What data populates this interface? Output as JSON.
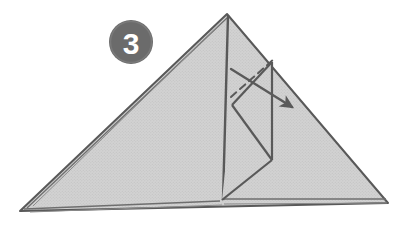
{
  "figure": {
    "kind": "origami-fold-instruction",
    "step_badge": {
      "number": "3",
      "shape": "filled-circle",
      "fill_color": "#6b6b6b",
      "text_color": "#ffffff",
      "center_x": 131,
      "center_y": 42,
      "radius": 22
    },
    "paper": {
      "fill_color": "#cfcfcf",
      "outline_color": "#595959",
      "texture": "halftone-dot-screen",
      "description": "Large flat triangle of folded paper seen from the front, apex at top center, long base at bottom."
    },
    "shapes": {
      "main_triangle": {
        "name": "main-triangle",
        "points": "227,14 20,211 388,203"
      },
      "layer_edges": [
        {
          "name": "left-layer-edge-1",
          "points": "227,18 27,208"
        },
        {
          "name": "left-layer-edge-2",
          "points": "222,22 33,206"
        },
        {
          "name": "bottom-layer-edge-1",
          "points": "24,209 220,201"
        },
        {
          "name": "bottom-layer-edge-2",
          "points": "30,212 222,205"
        },
        {
          "name": "bottom-layer-edge-3",
          "points": "222,199 386,199"
        },
        {
          "name": "bottom-layer-edge-4",
          "points": "224,204 387,203"
        }
      ],
      "center_fold_line": {
        "name": "center-vertical-fold",
        "points": "228,15 223,200"
      },
      "inner_flap": {
        "name": "inner-flap",
        "points": "272,62 272,160 222,200 232,105"
      },
      "inner_flap_edges": [
        {
          "name": "flap-right-edge",
          "points": "272,62 272,160"
        },
        {
          "name": "flap-lower-diagonal",
          "points": "272,160 222,200"
        },
        {
          "name": "flap-left-diagonal",
          "points": "232,105 272,160"
        },
        {
          "name": "flap-upper-diagonal",
          "points": "232,105 272,62"
        }
      ]
    },
    "annotations": {
      "fold_line": {
        "name": "valley-fold-dashed-line",
        "style": "dashed",
        "color": "#5a5a5a",
        "from": "231,97",
        "to": "274,59",
        "meaning": "fold crease"
      },
      "fold_arrow": {
        "name": "fold-direction-arrow",
        "style": "solid-with-arrowhead",
        "color": "#5a5a5a",
        "from": "231,69",
        "to": "292,107",
        "direction": "down-right",
        "meaning": "fold the flap over in this direction"
      }
    }
  }
}
